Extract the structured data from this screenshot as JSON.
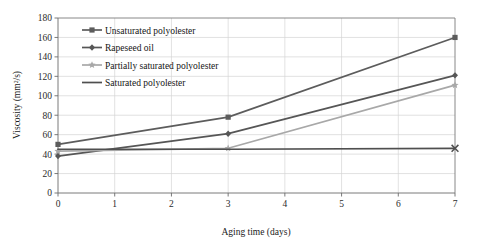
{
  "chart_data": {
    "type": "line",
    "title": "",
    "xlabel": "Aging time (days)",
    "ylabel": "Viscosity (mm²/s)",
    "x": [
      0,
      3,
      7
    ],
    "xlim": [
      0,
      7
    ],
    "ylim": [
      0,
      180
    ],
    "xticks": [
      "0",
      "1",
      "2",
      "3",
      "4",
      "5",
      "6",
      "7"
    ],
    "yticks": [
      "0",
      "20",
      "40",
      "60",
      "80",
      "100",
      "120",
      "140",
      "160",
      "180"
    ],
    "grid": "both",
    "legend_position": "upper-left-inside",
    "series": [
      {
        "name": "Unsaturated polyolester",
        "marker": "square",
        "color": "#5c5c5c",
        "values": [
          50,
          78,
          160
        ]
      },
      {
        "name": "Rapeseed oil",
        "marker": "diamond",
        "color": "#565656",
        "values": [
          38,
          61,
          121
        ]
      },
      {
        "name": "Partially saturated polyolester",
        "marker": "star",
        "color": "#a8a8a8",
        "values": [
          43,
          46,
          111
        ]
      },
      {
        "name": "Saturated polyolester",
        "marker": "cross",
        "color": "#4f4f4f",
        "values": [
          45,
          45,
          46
        ]
      }
    ]
  },
  "axes": {
    "x_title": "Aging time (days)",
    "y_title": "Viscosity (mm²/s)",
    "x_tick_labels": [
      "0",
      "1",
      "2",
      "3",
      "4",
      "5",
      "6",
      "7"
    ],
    "y_tick_labels": [
      "0",
      "20",
      "40",
      "60",
      "80",
      "100",
      "120",
      "140",
      "160",
      "180"
    ]
  },
  "legend": {
    "items": [
      {
        "label": "Unsaturated polyolester",
        "marker": "square-marker-icon",
        "color": "#5c5c5c"
      },
      {
        "label": "Rapeseed oil",
        "marker": "diamond-marker-icon",
        "color": "#565656"
      },
      {
        "label": "Partially saturated polyolester",
        "marker": "star-marker-icon",
        "color": "#a8a8a8"
      },
      {
        "label": "Saturated polyolester",
        "marker": "line-marker-icon",
        "color": "#4f4f4f"
      }
    ]
  },
  "colors": {
    "grid": "#d4d4d4",
    "axis": "#6b6b6b",
    "background": "#ffffff",
    "text": "#1a1a1a"
  }
}
